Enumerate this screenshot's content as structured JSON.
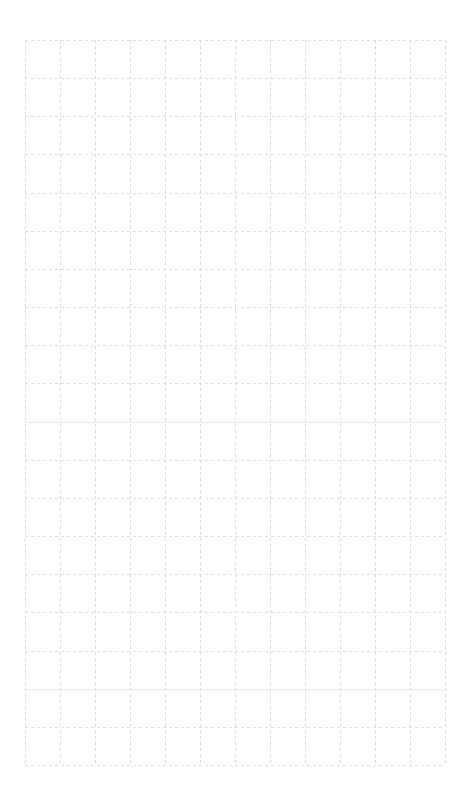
{
  "page": {
    "width": 468,
    "height": 810,
    "background_color": "#ffffff",
    "content_text": "",
    "has_text_content": false
  },
  "grid": {
    "name": "graph-paper-grid",
    "origin_x": 25,
    "origin_y": 40,
    "width": 420,
    "height": 725,
    "columns": 12,
    "rows": 19,
    "cell_width": 35,
    "cell_height": 38.16,
    "line_color": "#dedede",
    "line_color_horizontal": "#e0e0e0",
    "line_color_vertical": "#dcdcdc",
    "line_width": 1,
    "line_style": "dashed",
    "dash_length": 3,
    "dash_gap": 3,
    "background_color": "#ffffff",
    "vertical_line_positions": [
      0,
      35,
      70,
      105,
      140,
      175,
      210,
      245,
      280,
      315,
      350,
      385,
      420
    ],
    "horizontal_line_positions": [
      0,
      38.16,
      76.32,
      114.47,
      152.63,
      190.79,
      228.95,
      267.11,
      305.26,
      343.42,
      381.58,
      419.74,
      457.89,
      496.05,
      534.21,
      572.37,
      610.53,
      648.68,
      686.84,
      725
    ],
    "emphasized_row_indices": [
      10,
      17
    ]
  },
  "chart_data": {
    "type": "table",
    "title": "",
    "xlabel": "",
    "ylabel": "",
    "grid": true,
    "legend": null,
    "categories": [],
    "values": [],
    "series": [],
    "note": "Empty grid — no plotted data, no tick labels, no annotations present in the image."
  }
}
